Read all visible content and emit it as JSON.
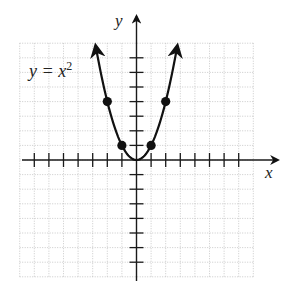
{
  "chart_data": {
    "type": "line",
    "title": "",
    "equation_label": "y = x",
    "equation_exponent": "2",
    "xlabel": "x",
    "ylabel": "y",
    "xlim": [
      -8,
      8
    ],
    "ylim": [
      -8,
      8
    ],
    "grid": true,
    "tick_interval": 1,
    "series": [
      {
        "name": "y = x^2",
        "function": "x^2",
        "marked_points": [
          {
            "x": -2,
            "y": 4
          },
          {
            "x": -1,
            "y": 1
          },
          {
            "x": 1,
            "y": 1
          },
          {
            "x": 2,
            "y": 4
          }
        ],
        "domain_shown": [
          -2.8,
          2.8
        ],
        "arrows_at_ends": true
      }
    ]
  },
  "colors": {
    "curve": "#111111",
    "axes": "#1a1a1a",
    "grid": "#bdbdbd",
    "background": "#ffffff"
  }
}
